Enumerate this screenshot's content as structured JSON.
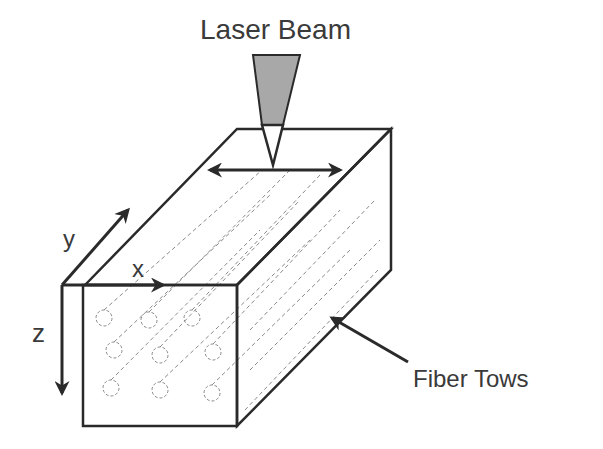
{
  "labels": {
    "laser_beam": "Laser Beam",
    "fiber_tows": "Fiber Tows",
    "axis_x": "x",
    "axis_y": "y",
    "axis_z": "z"
  },
  "colors": {
    "line": "#2a2a2a",
    "beam_fill": "#a8a8a8",
    "fiber": "#8a8a8a",
    "text": "#3a3a3a"
  },
  "fiber_cross_sections": [
    [
      104,
      318
    ],
    [
      149,
      320
    ],
    [
      192,
      318
    ],
    [
      114,
      350
    ],
    [
      160,
      355
    ],
    [
      213,
      352
    ],
    [
      111,
      388
    ],
    [
      160,
      390
    ],
    [
      212,
      393
    ]
  ]
}
